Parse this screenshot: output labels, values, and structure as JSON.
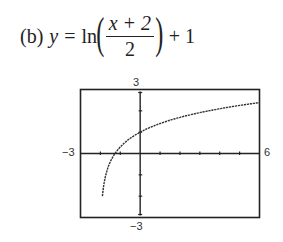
{
  "equation": {
    "label": "(b)",
    "lhs": "y",
    "equals": "=",
    "func": "ln",
    "numerator": "x + 2",
    "denominator": "2",
    "tail": "+ 1"
  },
  "window": {
    "x_min_label": "−3",
    "x_max_label": "6",
    "y_max_label": "3",
    "y_min_label": "−3"
  },
  "chart_data": {
    "type": "line",
    "xlabel": "",
    "ylabel": "",
    "xlim": [
      -3,
      6
    ],
    "ylim": [
      -3,
      3
    ],
    "xscale_ticks": [
      -2,
      -1,
      1,
      2,
      3,
      4,
      5
    ],
    "yscale_ticks": [
      -2,
      -1,
      1,
      2
    ],
    "grid": false,
    "series": [
      {
        "name": "y = ln((x + 2)/2) + 1",
        "x": [
          -1.9,
          -1.8,
          -1.6,
          -1.4,
          -1.264,
          -1.0,
          -0.5,
          0,
          0.5,
          1,
          1.5,
          2,
          3,
          4,
          5,
          6
        ],
        "y": [
          -2.0,
          -1.3,
          -0.61,
          -0.2,
          0.0,
          0.31,
          0.78,
          1.0,
          1.22,
          1.41,
          1.56,
          1.69,
          1.92,
          2.1,
          2.25,
          2.39
        ]
      }
    ],
    "annotations": [
      "x-intercept ≈ −1.26",
      "y-intercept = 1",
      "vertical asymptote x = −2"
    ]
  }
}
